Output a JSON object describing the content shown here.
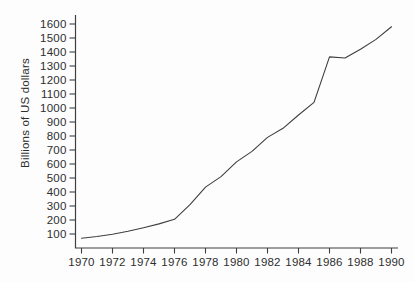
{
  "chart_data": {
    "type": "line",
    "title": "",
    "xlabel": "",
    "ylabel": "Billions of US dollars",
    "x": [
      1970,
      1971,
      1972,
      1973,
      1974,
      1975,
      1976,
      1977,
      1978,
      1979,
      1980,
      1981,
      1982,
      1983,
      1984,
      1985,
      1986,
      1987,
      1988,
      1989,
      1990
    ],
    "values": [
      70,
      82,
      98,
      120,
      145,
      172,
      205,
      310,
      435,
      510,
      615,
      690,
      790,
      855,
      950,
      1040,
      1365,
      1357,
      1420,
      1490,
      1580
    ],
    "x_ticks": [
      1970,
      1972,
      1974,
      1976,
      1978,
      1980,
      1982,
      1984,
      1986,
      1988,
      1990
    ],
    "y_ticks": [
      100,
      200,
      300,
      400,
      500,
      600,
      700,
      800,
      900,
      1000,
      1100,
      1200,
      1300,
      1400,
      1500,
      1600
    ],
    "xlim": [
      1969.5,
      1990.5
    ],
    "ylim": [
      0,
      1670
    ],
    "grid": false,
    "legend": "none",
    "line_color": "#3f3f3f",
    "axis_color": "#3f3f3f",
    "text_color": "#2e2e2e",
    "background_color": "#fdfdfd"
  }
}
